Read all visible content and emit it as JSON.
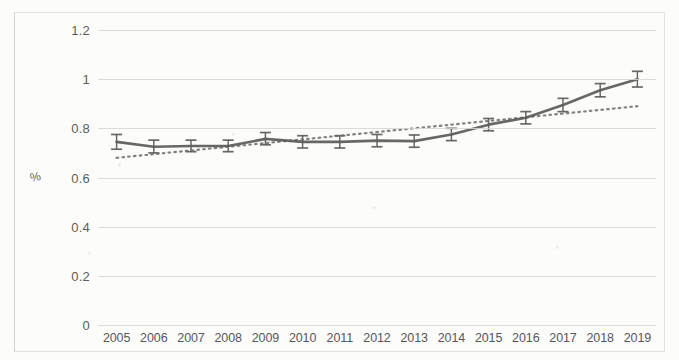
{
  "chart_data": {
    "type": "line",
    "title": "",
    "xlabel": "",
    "ylabel": "%",
    "ylim": [
      0,
      1.2
    ],
    "yticks": [
      "0",
      "0.2",
      "0.4",
      "0.6",
      "0.8",
      "1",
      "1.2"
    ],
    "ytick_values": [
      0,
      0.2,
      0.4,
      0.6,
      0.8,
      1.0,
      1.2
    ],
    "grid": true,
    "legend": "none",
    "categories": [
      "2005",
      "2006",
      "2007",
      "2008",
      "2009",
      "2010",
      "2011",
      "2012",
      "2013",
      "2014",
      "2015",
      "2016",
      "2017",
      "2018",
      "2019"
    ],
    "series": [
      {
        "name": "Prevalence",
        "style": "line-with-error-bars",
        "color": "#5a5a58",
        "values": [
          0.745,
          0.725,
          0.728,
          0.728,
          0.757,
          0.745,
          0.745,
          0.75,
          0.748,
          0.775,
          0.815,
          0.843,
          0.895,
          0.955,
          1.0
        ],
        "error_low": [
          0.715,
          0.7,
          0.705,
          0.705,
          0.733,
          0.72,
          0.72,
          0.725,
          0.723,
          0.75,
          0.79,
          0.818,
          0.868,
          0.928,
          0.968
        ],
        "error_high": [
          0.775,
          0.752,
          0.752,
          0.752,
          0.783,
          0.77,
          0.77,
          0.775,
          0.773,
          0.8,
          0.84,
          0.868,
          0.922,
          0.982,
          1.032
        ]
      },
      {
        "name": "Linear trend",
        "style": "dotted",
        "color": "#6d6d6a",
        "endpoints": [
          0.68,
          0.89
        ]
      }
    ]
  },
  "axis": {
    "y_title": "%"
  }
}
